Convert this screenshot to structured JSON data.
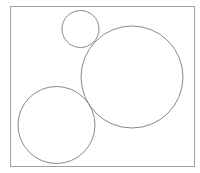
{
  "canvas": {
    "width": 200,
    "height": 173,
    "background": "#ffffff"
  },
  "frame": {
    "x": 10,
    "y": 6,
    "width": 184,
    "height": 160,
    "stroke": "#a0a0a0"
  },
  "circles": [
    {
      "name": "small-circle",
      "cx": 80.5,
      "cy": 29,
      "r": 18.5,
      "stroke": "#8a8a8a"
    },
    {
      "name": "large-circle",
      "cx": 132,
      "cy": 77,
      "r": 51,
      "stroke": "#8a8a8a"
    },
    {
      "name": "medium-circle",
      "cx": 56.5,
      "cy": 125,
      "r": 38.5,
      "stroke": "#8a8a8a"
    }
  ]
}
